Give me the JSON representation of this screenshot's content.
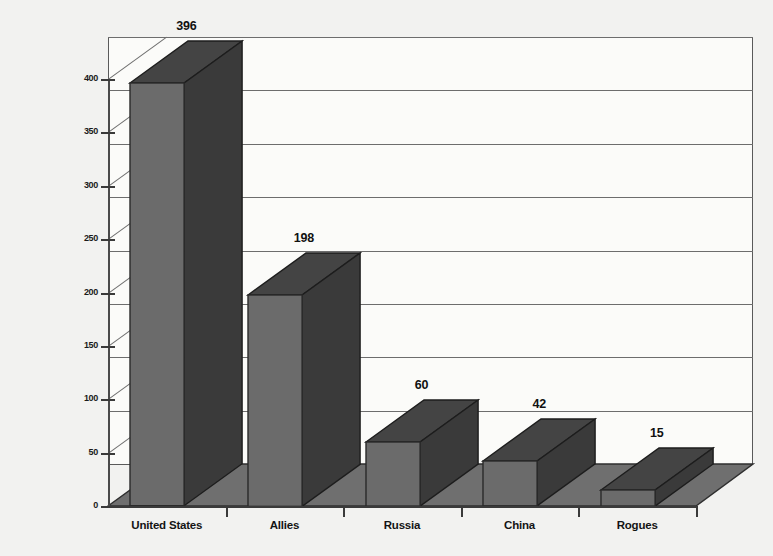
{
  "chart_data": {
    "type": "bar",
    "title": "",
    "subtitle": "",
    "xlabel": "",
    "ylabel": "",
    "categories": [
      "United States",
      "Allies",
      "Russia",
      "China",
      "Rogues"
    ],
    "values": [
      396,
      198,
      60,
      42,
      15
    ],
    "data_labels": [
      "396",
      "198",
      "60",
      "42",
      "15"
    ],
    "ylim": [
      0,
      400
    ],
    "ytick_values": [
      0,
      50,
      100,
      150,
      200,
      250,
      300,
      350,
      400
    ],
    "ytick_labels": [
      "0",
      "50",
      "100",
      "150",
      "200",
      "250",
      "300",
      "350",
      "400"
    ],
    "grid": true,
    "grid_axis": "y",
    "legend": false,
    "legend_position": "none",
    "three_d": true,
    "series": [
      {
        "name": "",
        "values": [
          396,
          198,
          60,
          42,
          15
        ]
      }
    ],
    "colors": {
      "bar_front": "#6b6b6b",
      "bar_side": "#3a3a3a",
      "bar_top": "#444444",
      "floor": "#6f6f6f",
      "background": "#f2f2f0",
      "plot_background": "#fbfbf9",
      "gridline": "#6d6d6d",
      "axis": "#3a3a3a",
      "text": "#111111"
    }
  }
}
